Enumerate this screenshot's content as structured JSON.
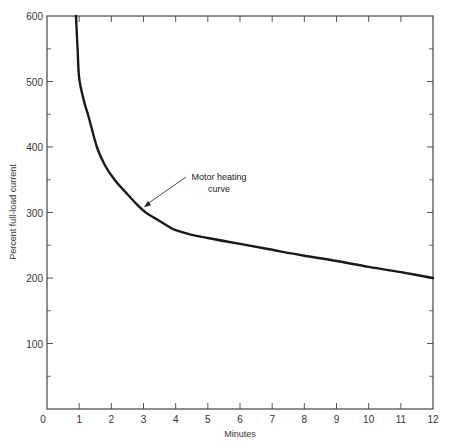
{
  "chart_data": {
    "type": "line",
    "title": "",
    "xlabel": "Minutes",
    "ylabel": "Percent full-load current",
    "xlim": [
      0,
      12
    ],
    "ylim": [
      0,
      600
    ],
    "x_ticks": [
      0,
      1,
      2,
      3,
      4,
      5,
      6,
      7,
      8,
      9,
      10,
      11,
      12
    ],
    "y_ticks": [
      0,
      100,
      200,
      300,
      400,
      500,
      600
    ],
    "y_minor_ticks": [
      50,
      150,
      250,
      350,
      450,
      550
    ],
    "grid": false,
    "legend": null,
    "series": [
      {
        "name": "Motor heating curve",
        "x": [
          0.9,
          0.95,
          1.0,
          1.15,
          1.3,
          1.55,
          1.8,
          2.1,
          2.5,
          2.8,
          3.07,
          3.4,
          3.8,
          4.0,
          4.5,
          5.0,
          6.0,
          7.0,
          8.0,
          9.0,
          10.0,
          11.0,
          12.0
        ],
        "values": [
          600,
          550,
          505,
          470,
          445,
          400,
          372,
          350,
          328,
          312,
          300,
          290,
          278,
          273,
          266,
          261,
          252,
          243,
          234,
          226,
          217,
          209,
          200
        ]
      }
    ],
    "annotations": [
      {
        "text_line1": "Motor heating",
        "text_line2": "curve",
        "points_to": {
          "x": 2.95,
          "y": 305
        }
      }
    ]
  }
}
